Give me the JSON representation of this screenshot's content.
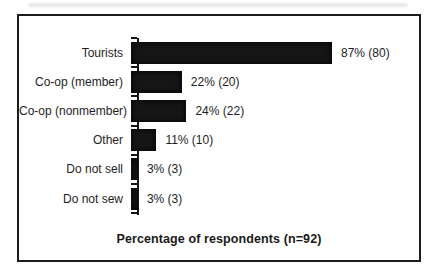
{
  "figure": {
    "background": "#ffffff",
    "frame_border_color": "#1c1c1c"
  },
  "chart_data": {
    "type": "bar",
    "orientation": "horizontal",
    "title": "",
    "xlabel": "Percentage of respondents (n=92)",
    "ylabel": "",
    "xlim": [
      0,
      100
    ],
    "grid": false,
    "legend": false,
    "n_total": 92,
    "bar_color": "#161616",
    "categories": [
      "Tourists",
      "Co-op (member)",
      "Co-op (nonmember)",
      "Other",
      "Do not sell",
      "Do not sew"
    ],
    "values": [
      87,
      22,
      24,
      11,
      3,
      3
    ],
    "counts": [
      80,
      20,
      22,
      10,
      3,
      3
    ],
    "value_labels": [
      "87% (80)",
      "22% (20)",
      "24% (22)",
      "11% (10)",
      "3% (3)",
      "3% (3)"
    ]
  }
}
